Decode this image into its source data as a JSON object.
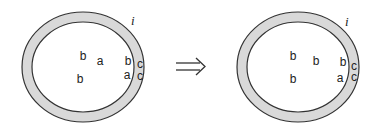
{
  "diagram": {
    "arrow": "⇒",
    "colors": {
      "ring_fill": "#d9d9d9",
      "stroke": "#333333",
      "text": "#222222"
    },
    "left_cell": {
      "region_label": "i",
      "interior": [
        {
          "t": "b",
          "x": 83,
          "y": 60
        },
        {
          "t": "a",
          "x": 100,
          "y": 65
        },
        {
          "t": "b",
          "x": 80,
          "y": 83
        }
      ],
      "boundary": [
        {
          "t": "b",
          "x": 128,
          "y": 65
        },
        {
          "t": "c",
          "x": 140,
          "y": 68
        },
        {
          "t": "a",
          "x": 127,
          "y": 79
        },
        {
          "t": "c",
          "x": 140,
          "y": 80
        }
      ]
    },
    "right_cell": {
      "region_label": "i",
      "interior": [
        {
          "t": "b",
          "x": 293,
          "y": 60
        },
        {
          "t": "b",
          "x": 316,
          "y": 65
        },
        {
          "t": "b",
          "x": 293,
          "y": 83
        }
      ],
      "boundary": [
        {
          "t": "b",
          "x": 343,
          "y": 66
        },
        {
          "t": "c",
          "x": 354,
          "y": 70
        },
        {
          "t": "a",
          "x": 340,
          "y": 82
        },
        {
          "t": "c",
          "x": 354,
          "y": 81
        }
      ]
    }
  }
}
